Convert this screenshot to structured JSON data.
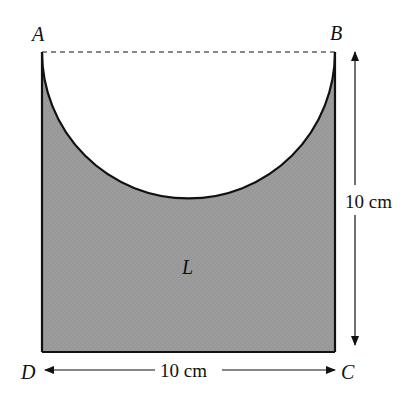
{
  "diagram": {
    "vertices": {
      "A": "A",
      "B": "B",
      "C": "C",
      "D": "D"
    },
    "region_label": "L",
    "height_label": "10 cm",
    "width_label": "10 cm",
    "colors": {
      "shaded_fill": "#9a9a9a",
      "stroke": "#111111",
      "background": "#ffffff"
    }
  }
}
